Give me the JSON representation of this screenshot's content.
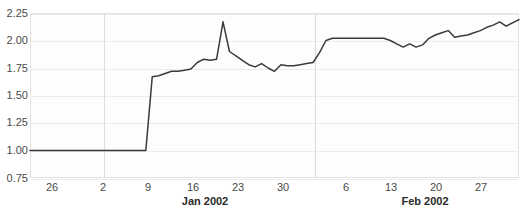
{
  "chart_data": {
    "type": "line",
    "title": "",
    "xlabel": "",
    "ylabel": "",
    "ylim": [
      0.75,
      2.25
    ],
    "yticks": [
      0.75,
      1.0,
      1.25,
      1.5,
      1.75,
      2.0,
      2.25
    ],
    "ytick_labels": [
      "0.75",
      "1.00",
      "1.25",
      "1.50",
      "1.75",
      "2.00",
      "2.25"
    ],
    "grid": true,
    "legend": "none",
    "xtick_labels": [
      "26",
      "2",
      "9",
      "16",
      "23",
      "30",
      "6",
      "13",
      "20",
      "27"
    ],
    "month_labels": [
      "Jan 2002",
      "Feb 2002"
    ],
    "line_color": "#3a3a3a",
    "series": [
      {
        "name": "value",
        "x": [
          0,
          1,
          2,
          3,
          4,
          5,
          6,
          7,
          8,
          9,
          10,
          11,
          12,
          13,
          14,
          15,
          16,
          17,
          18,
          19,
          20,
          21,
          22,
          23,
          24,
          25,
          26,
          27,
          28,
          29,
          30,
          31,
          32,
          33,
          34,
          35,
          36,
          37,
          38,
          39,
          40,
          41,
          42,
          43,
          44,
          45,
          46,
          47,
          48,
          49,
          50,
          51,
          52,
          53,
          54,
          55,
          56,
          57,
          58,
          59,
          60,
          61,
          62,
          63,
          64,
          65,
          66,
          67,
          68,
          69,
          70,
          71,
          72,
          73,
          74,
          75,
          76
        ],
        "values": [
          1.0,
          1.0,
          1.0,
          1.0,
          1.0,
          1.0,
          1.0,
          1.0,
          1.0,
          1.0,
          1.0,
          1.0,
          1.0,
          1.0,
          1.0,
          1.0,
          1.0,
          1.0,
          1.0,
          1.67,
          1.68,
          1.7,
          1.72,
          1.72,
          1.73,
          1.74,
          1.8,
          1.83,
          1.82,
          1.83,
          2.17,
          1.9,
          1.86,
          1.82,
          1.78,
          1.76,
          1.79,
          1.75,
          1.72,
          1.78,
          1.77,
          1.77,
          1.78,
          1.79,
          1.8,
          1.89,
          2.0,
          2.02,
          2.02,
          2.02,
          2.02,
          2.02,
          2.02,
          2.02,
          2.02,
          2.02,
          2.0,
          1.97,
          1.94,
          1.97,
          1.94,
          1.96,
          2.02,
          2.05,
          2.07,
          2.09,
          2.03,
          2.04,
          2.05,
          2.07,
          2.09,
          2.12,
          2.14,
          2.17,
          2.13,
          2.16,
          2.19
        ]
      }
    ]
  },
  "axis": {
    "x_ticks": [
      {
        "label": "26",
        "x": 52
      },
      {
        "label": "2",
        "x": 103
      },
      {
        "label": "9",
        "x": 148
      },
      {
        "label": "16",
        "x": 193
      },
      {
        "label": "23",
        "x": 238
      },
      {
        "label": "30",
        "x": 283
      },
      {
        "label": "6",
        "x": 346
      },
      {
        "label": "13",
        "x": 391
      },
      {
        "label": "20",
        "x": 436
      },
      {
        "label": "27",
        "x": 481
      }
    ],
    "month_ticks": [
      {
        "label": "Jan 2002",
        "x": 205
      },
      {
        "label": "Feb 2002",
        "x": 425
      }
    ],
    "y_ticks": [
      {
        "label": "2.25",
        "y": 13
      },
      {
        "label": "2.00",
        "y": 40
      },
      {
        "label": "1.75",
        "y": 68
      },
      {
        "label": "1.50",
        "y": 95
      },
      {
        "label": "1.25",
        "y": 122
      },
      {
        "label": "1.00",
        "y": 150
      },
      {
        "label": "0.75",
        "y": 178
      }
    ],
    "month_dividers": [
      103,
      314
    ]
  },
  "title_remnant": ""
}
